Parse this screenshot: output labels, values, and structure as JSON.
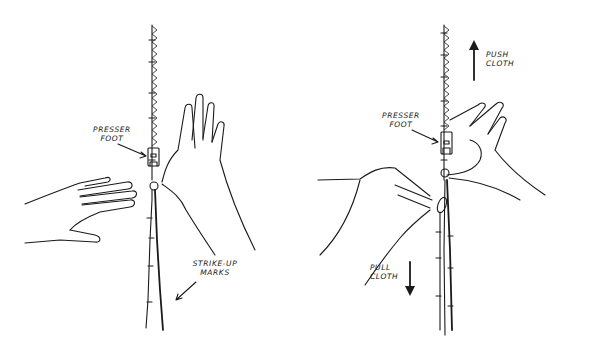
{
  "figures": [
    {
      "id": "left",
      "labels": {
        "presser_foot": [
          "Presser",
          "Foot"
        ],
        "strike_marks": [
          "Strike-up",
          "Marks"
        ]
      }
    },
    {
      "id": "right",
      "labels": {
        "presser_foot": [
          "Presser",
          "Foot"
        ],
        "push": [
          "Push",
          "Cloth"
        ],
        "pull": [
          "Pull",
          "Cloth"
        ]
      }
    }
  ],
  "colors": {
    "ink": "#1a1a1a",
    "background": "#ffffff"
  }
}
